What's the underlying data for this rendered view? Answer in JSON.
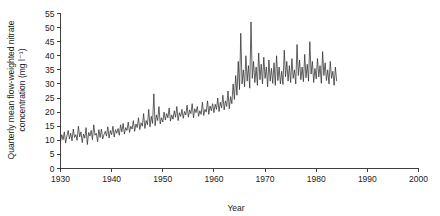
{
  "chart_data": {
    "type": "line",
    "title": "",
    "xlabel": "Year",
    "ylabel": "Quarterly mean flow-weighted nitrate concentration (mg l⁻¹)",
    "ylabel_line1": "Quarterly mean flow-weighted nitrate",
    "ylabel_line2": "concentration (mg l⁻¹)",
    "xlim": [
      1930,
      2000
    ],
    "ylim": [
      0,
      55
    ],
    "xticks": [
      1930,
      1940,
      1950,
      1960,
      1970,
      1980,
      1990,
      2000
    ],
    "xtick_labels": [
      "1930",
      "1940",
      "1950",
      "1960",
      "1970",
      "1980",
      "1990",
      "2000"
    ],
    "yticks": [
      0,
      5,
      10,
      15,
      20,
      25,
      30,
      35,
      40,
      45,
      50,
      55
    ],
    "ytick_labels": [
      "0",
      "5",
      "10",
      "15",
      "20",
      "25",
      "30",
      "35",
      "40",
      "45",
      "50",
      "55"
    ],
    "grid": false,
    "legend": "none",
    "line_color": "#2f2f2f",
    "series": [
      {
        "name": "Quarterly mean flow-weighted nitrate concentration",
        "x_start": 1930.0,
        "x_step": 0.25,
        "values": [
          9.5,
          12.0,
          10.2,
          13.0,
          9.0,
          11.5,
          13.5,
          10.5,
          12.5,
          9.8,
          14.0,
          11.0,
          12.0,
          10.0,
          15.0,
          11.2,
          13.0,
          9.2,
          12.2,
          10.8,
          14.5,
          8.5,
          12.8,
          11.5,
          13.5,
          10.2,
          15.5,
          11.8,
          12.5,
          9.5,
          13.8,
          11.0,
          14.0,
          10.5,
          12.0,
          13.2,
          11.5,
          14.8,
          10.8,
          13.5,
          12.0,
          15.0,
          11.2,
          13.8,
          12.5,
          14.2,
          11.8,
          15.5,
          13.0,
          16.0,
          12.2,
          14.5,
          13.5,
          16.5,
          12.8,
          15.0,
          14.0,
          17.0,
          13.2,
          15.8,
          14.5,
          18.0,
          13.8,
          16.2,
          15.0,
          19.5,
          14.2,
          17.0,
          15.5,
          21.0,
          14.8,
          18.5,
          16.0,
          26.5,
          15.2,
          19.0,
          17.0,
          22.0,
          15.8,
          18.0,
          16.5,
          20.0,
          17.2,
          19.5,
          18.0,
          21.5,
          16.8,
          19.0,
          17.5,
          20.5,
          18.2,
          22.0,
          17.0,
          19.8,
          18.5,
          21.0,
          17.8,
          20.2,
          19.0,
          22.5,
          18.2,
          20.8,
          19.5,
          23.0,
          18.0,
          21.2,
          19.8,
          22.0,
          18.5,
          20.5,
          19.2,
          23.5,
          18.8,
          21.0,
          20.0,
          24.0,
          19.2,
          22.2,
          20.5,
          23.0,
          19.8,
          22.8,
          21.0,
          25.0,
          20.2,
          23.5,
          21.5,
          26.0,
          20.8,
          24.0,
          22.0,
          27.5,
          21.2,
          25.5,
          23.0,
          30.0,
          24.5,
          33.0,
          26.0,
          38.0,
          28.0,
          48.0,
          30.0,
          35.0,
          29.0,
          40.0,
          31.0,
          36.5,
          28.5,
          52.0,
          32.0,
          38.0,
          30.5,
          36.0,
          29.5,
          41.0,
          31.5,
          37.0,
          30.0,
          39.5,
          32.0,
          36.0,
          29.0,
          38.5,
          31.0,
          35.5,
          30.2,
          37.5,
          29.5,
          40.0,
          31.2,
          36.0,
          30.0,
          34.5,
          29.8,
          42.0,
          32.5,
          38.0,
          31.0,
          36.5,
          30.5,
          39.0,
          32.0,
          35.0,
          30.0,
          44.0,
          33.0,
          38.5,
          31.5,
          36.0,
          30.8,
          40.5,
          32.2,
          37.0,
          31.0,
          45.0,
          33.5,
          38.0,
          30.5,
          35.5,
          31.8,
          39.0,
          32.5,
          36.5,
          30.2,
          41.5,
          33.0,
          37.5,
          31.2,
          35.0,
          30.0,
          38.0,
          32.0,
          34.5,
          29.5,
          36.0,
          31.0
        ]
      }
    ]
  }
}
